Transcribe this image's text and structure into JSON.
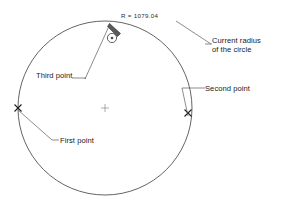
{
  "diagram": {
    "background_color": "#ffffff",
    "line_color": "#3c3c3c",
    "text_color": "#1a1a1a",
    "circle": {
      "center_x": 105,
      "center_y": 108,
      "radius_px": 87,
      "center_mark": "plus"
    },
    "radius_readout": {
      "label": "R = 1079.04",
      "value": 1079.04,
      "symbol": "R"
    },
    "annotations": [
      {
        "id": "current-radius",
        "line1": "Current radius",
        "line2": "of the circle",
        "leader_from_x": 212,
        "leader_from_y": 44,
        "leader_to_x": 176,
        "leader_to_y": 22
      },
      {
        "id": "second-point",
        "label": "Second point",
        "marker": "x",
        "marker_x": 188,
        "marker_y": 113
      },
      {
        "id": "third-point",
        "label": "Third point",
        "marker": "cursor",
        "marker_x": 110,
        "marker_y": 24
      },
      {
        "id": "first-point",
        "label": "First point",
        "marker": "x",
        "marker_x": 18,
        "marker_y": 108
      }
    ],
    "cursor": {
      "icon": "pencil-cursor-icon",
      "ring_icon": "circle-snap-icon",
      "x": 110,
      "y": 24
    }
  }
}
